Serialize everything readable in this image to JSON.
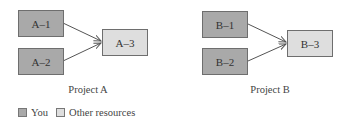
{
  "projects": [
    {
      "caption": "Project A",
      "nodes": [
        {
          "id": "A-1",
          "label": "A–1",
          "role": "you"
        },
        {
          "id": "A-2",
          "label": "A–2",
          "role": "you"
        },
        {
          "id": "A-3",
          "label": "A–3",
          "role": "other"
        }
      ],
      "edges": [
        [
          "A-1",
          "A-3"
        ],
        [
          "A-2",
          "A-3"
        ]
      ]
    },
    {
      "caption": "Project B",
      "nodes": [
        {
          "id": "B-1",
          "label": "B–1",
          "role": "you"
        },
        {
          "id": "B-2",
          "label": "B–2",
          "role": "you"
        },
        {
          "id": "B-3",
          "label": "B–3",
          "role": "other"
        }
      ],
      "edges": [
        [
          "B-1",
          "B-3"
        ],
        [
          "B-2",
          "B-3"
        ]
      ]
    }
  ],
  "legend": {
    "you": "You",
    "other": "Other resources"
  },
  "colors": {
    "you": "#a9a9a9",
    "other": "#dedede",
    "border": "#6e6e6e"
  }
}
